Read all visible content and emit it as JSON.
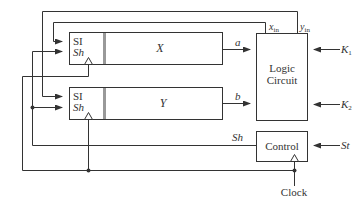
{
  "diagram": {
    "registers": [
      {
        "id": "X",
        "name": "X",
        "si_label": "SI",
        "sh_label": "Sh"
      },
      {
        "id": "Y",
        "name": "Y",
        "si_label": "SI",
        "sh_label": "Sh"
      }
    ],
    "logic_circuit": {
      "line1": "Logic",
      "line2": "Circuit"
    },
    "control": {
      "label": "Control"
    },
    "signals": {
      "a": "a",
      "b": "b",
      "x_in_base": "x",
      "x_in_sub": "in",
      "y_in_base": "y",
      "y_in_sub": "in",
      "k1_base": "K",
      "k1_sub": "1",
      "k2_base": "K",
      "k2_sub": "2",
      "sh": "Sh",
      "st": "St",
      "clock": "Clock"
    },
    "colors": {
      "line": "#333333",
      "divider": "#999999",
      "background": "#ffffff"
    }
  }
}
